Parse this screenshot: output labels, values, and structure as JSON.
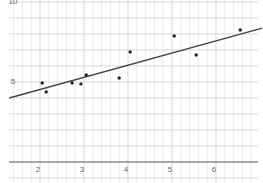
{
  "chart_data": {
    "type": "scatter",
    "title": "",
    "xlabel": "",
    "ylabel": "",
    "xlim": [
      1.2,
      7.1
    ],
    "ylim": [
      -1.2,
      10.1
    ],
    "grid": true,
    "legend": null,
    "x_ticks": [
      2,
      3,
      4,
      5,
      6
    ],
    "x_tick_labels": [
      "2",
      "3",
      "4",
      "5",
      "6"
    ],
    "y_ticks": [
      5,
      10
    ],
    "y_tick_labels": [
      "5",
      "10"
    ],
    "series": [
      {
        "name": "points",
        "type": "scatter",
        "x": [
          2.05,
          2.14,
          2.73,
          2.93,
          3.05,
          3.8,
          4.05,
          5.05,
          5.55,
          6.55
        ],
        "y": [
          4.94,
          4.38,
          4.94,
          4.88,
          5.44,
          5.25,
          6.88,
          7.88,
          6.69,
          8.25
        ],
        "color": "#222222"
      },
      {
        "name": "trend line",
        "type": "line",
        "slope": 0.76,
        "intercept": 3.01,
        "x_range": [
          1.3,
          7.05
        ],
        "color": "#444444"
      }
    ]
  },
  "colors": {
    "grid_minor": "#ececec",
    "grid_major": "#d8d8d8",
    "axis": "#555555",
    "point": "#222222",
    "line": "#444444",
    "label": "#666666"
  }
}
